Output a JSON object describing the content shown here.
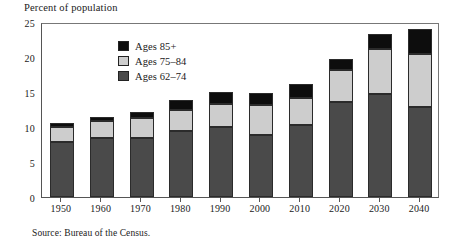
{
  "figure": {
    "title": "Percent of population",
    "source_note": "Source: Bureau of the Census."
  },
  "legend": {
    "position": "inside-top-left",
    "items": [
      {
        "label": "Ages 85+",
        "color": "#0d0d0d",
        "key": "ages_85_plus"
      },
      {
        "label": "Ages 75–84",
        "color": "#cdcdcd",
        "key": "ages_75_84"
      },
      {
        "label": "Ages 62–74",
        "color": "#4a4a4a",
        "key": "ages_62_74"
      }
    ]
  },
  "chart_data": {
    "type": "bar",
    "stacked": true,
    "title": "Percent of population",
    "xlabel": "",
    "ylabel": "Percent of population",
    "ylim": [
      0,
      25
    ],
    "yticks": [
      0,
      5,
      10,
      15,
      20,
      25
    ],
    "ytick_labels": [
      "0",
      "5",
      "10",
      "15",
      "20",
      "25"
    ],
    "grid": false,
    "categories": [
      "1950",
      "1960",
      "1970",
      "1980",
      "1990",
      "2000",
      "2010",
      "2020",
      "2030",
      "2040"
    ],
    "series": [
      {
        "name": "Ages 62–74",
        "color": "#4a4a4a",
        "values": [
          7.9,
          8.5,
          8.5,
          9.4,
          10.0,
          8.9,
          10.3,
          13.6,
          14.7,
          12.8
        ]
      },
      {
        "name": "Ages 75–84",
        "color": "#cdcdcd",
        "values": [
          2.1,
          2.4,
          2.8,
          3.1,
          3.3,
          4.3,
          3.8,
          4.5,
          6.4,
          7.6
        ]
      },
      {
        "name": "Ages 85+",
        "color": "#0d0d0d",
        "values": [
          0.6,
          0.6,
          0.9,
          1.4,
          1.7,
          1.6,
          2.0,
          1.6,
          2.2,
          3.6
        ]
      }
    ],
    "totals": [
      10.6,
      11.5,
      12.2,
      13.9,
      15.0,
      14.8,
      16.1,
      19.7,
      23.3,
      24.0
    ]
  }
}
